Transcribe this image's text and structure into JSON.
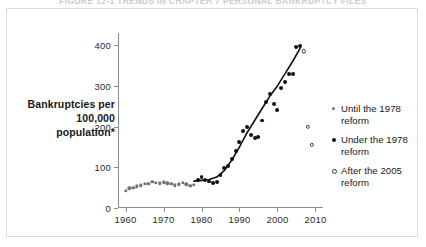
{
  "figure": {
    "title": "FIGURE 12-1   TRENDS IN CHAPTER 7 PERSONAL BANKRUPTCY FILES"
  },
  "axis": {
    "ylabel": "Bankruptcies per 100,000 population*",
    "ytick_labels": [
      "0",
      "100",
      "200",
      "300",
      "400"
    ],
    "xtick_labels": [
      "1960",
      "1970",
      "1980",
      "1990",
      "2000",
      "2010"
    ]
  },
  "legend": {
    "items": [
      {
        "label": "Until the 1978 reform",
        "marker": "small-gray-dot-icon"
      },
      {
        "label": "Under the 1978 reform",
        "marker": "filled-black-dot-icon"
      },
      {
        "label": "After the 2005 reform",
        "marker": "hollow-circle-icon"
      }
    ]
  },
  "chart_data": {
    "type": "scatter",
    "title": "FIGURE 12-1   TRENDS IN CHAPTER 7 PERSONAL BANKRUPTCY FILES",
    "xlabel": "",
    "ylabel": "Bankruptcies per 100,000 population*",
    "xlim": [
      1958,
      2012
    ],
    "ylim": [
      0,
      430
    ],
    "yticks": [
      0,
      100,
      200,
      300,
      400
    ],
    "xticks": [
      1960,
      1970,
      1980,
      1990,
      2000,
      2010
    ],
    "grid": false,
    "legend_position": "right",
    "series": [
      {
        "name": "Until the 1978 reform",
        "marker": "small-gray-dot",
        "color": "#6e7276",
        "points": [
          {
            "x": 1960,
            "y": 42
          },
          {
            "x": 1961,
            "y": 48
          },
          {
            "x": 1962,
            "y": 50
          },
          {
            "x": 1963,
            "y": 53
          },
          {
            "x": 1964,
            "y": 56
          },
          {
            "x": 1965,
            "y": 59
          },
          {
            "x": 1966,
            "y": 60
          },
          {
            "x": 1967,
            "y": 64
          },
          {
            "x": 1968,
            "y": 62
          },
          {
            "x": 1969,
            "y": 61
          },
          {
            "x": 1970,
            "y": 63
          },
          {
            "x": 1971,
            "y": 61
          },
          {
            "x": 1972,
            "y": 59
          },
          {
            "x": 1973,
            "y": 56
          },
          {
            "x": 1974,
            "y": 58
          },
          {
            "x": 1975,
            "y": 62
          },
          {
            "x": 1976,
            "y": 58
          },
          {
            "x": 1977,
            "y": 55
          },
          {
            "x": 1978,
            "y": 57
          }
        ]
      },
      {
        "name": "Under the 1978 reform",
        "marker": "filled-black-dot",
        "color": "#111111",
        "points": [
          {
            "x": 1979,
            "y": 68
          },
          {
            "x": 1980,
            "y": 76
          },
          {
            "x": 1981,
            "y": 68
          },
          {
            "x": 1982,
            "y": 65
          },
          {
            "x": 1983,
            "y": 62
          },
          {
            "x": 1984,
            "y": 64
          },
          {
            "x": 1985,
            "y": 82
          },
          {
            "x": 1986,
            "y": 98
          },
          {
            "x": 1987,
            "y": 102
          },
          {
            "x": 1988,
            "y": 120
          },
          {
            "x": 1989,
            "y": 140
          },
          {
            "x": 1990,
            "y": 163
          },
          {
            "x": 1991,
            "y": 190
          },
          {
            "x": 1992,
            "y": 198
          },
          {
            "x": 1993,
            "y": 180
          },
          {
            "x": 1994,
            "y": 172
          },
          {
            "x": 1995,
            "y": 175
          },
          {
            "x": 1996,
            "y": 215
          },
          {
            "x": 1997,
            "y": 260
          },
          {
            "x": 1998,
            "y": 280
          },
          {
            "x": 1999,
            "y": 255
          },
          {
            "x": 2000,
            "y": 240
          },
          {
            "x": 2001,
            "y": 295
          },
          {
            "x": 2002,
            "y": 310
          },
          {
            "x": 2003,
            "y": 330
          },
          {
            "x": 2004,
            "y": 330
          },
          {
            "x": 2005,
            "y": 395
          },
          {
            "x": 2006,
            "y": 398
          }
        ]
      },
      {
        "name": "After the 2005 reform",
        "marker": "hollow-circle",
        "color": "#3a3a3a",
        "points": [
          {
            "x": 2007,
            "y": 385
          },
          {
            "x": 2008,
            "y": 200
          },
          {
            "x": 2009,
            "y": 155
          }
        ]
      }
    ],
    "trend_line": {
      "name": "fitted trend",
      "color": "#111111",
      "points": [
        {
          "x": 1978,
          "y": 66
        },
        {
          "x": 1980,
          "y": 68
        },
        {
          "x": 1982,
          "y": 70
        },
        {
          "x": 1984,
          "y": 76
        },
        {
          "x": 1986,
          "y": 92
        },
        {
          "x": 1988,
          "y": 118
        },
        {
          "x": 1990,
          "y": 150
        },
        {
          "x": 1992,
          "y": 185
        },
        {
          "x": 1994,
          "y": 215
        },
        {
          "x": 1996,
          "y": 245
        },
        {
          "x": 1998,
          "y": 275
        },
        {
          "x": 2000,
          "y": 300
        },
        {
          "x": 2002,
          "y": 330
        },
        {
          "x": 2004,
          "y": 360
        },
        {
          "x": 2006,
          "y": 393
        }
      ]
    }
  }
}
